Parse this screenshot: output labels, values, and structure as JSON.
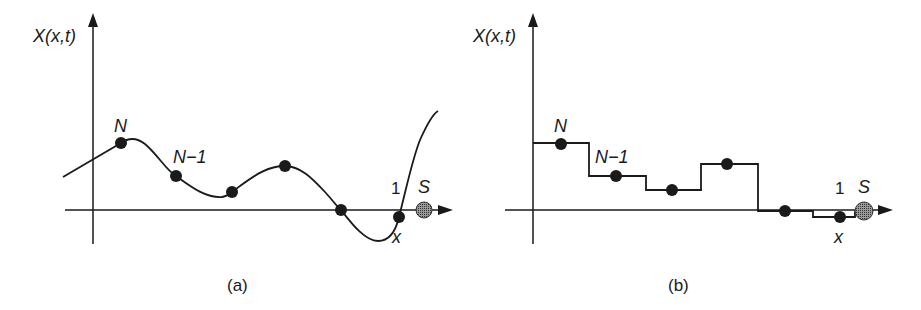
{
  "panels": [
    {
      "id": "a",
      "caption": "(a)",
      "y_axis_label": "X(x,t)",
      "curve_type": "smooth",
      "labels": {
        "top_point": "N",
        "second_point": "N−1",
        "last_point": "1",
        "sink": "S",
        "position": "x"
      },
      "points": [
        {
          "x": 121,
          "y": 143
        },
        {
          "x": 176,
          "y": 176
        },
        {
          "x": 232,
          "y": 192
        },
        {
          "x": 285,
          "y": 166
        },
        {
          "x": 341,
          "y": 210
        },
        {
          "x": 399,
          "y": 217
        }
      ]
    },
    {
      "id": "b",
      "caption": "(b)",
      "y_axis_label": "X(x,t)",
      "curve_type": "step",
      "labels": {
        "top_point": "N",
        "second_point": "N−1",
        "last_point": "1",
        "sink": "S",
        "position": "x"
      },
      "points": [
        {
          "x": 561,
          "y": 144
        },
        {
          "x": 616,
          "y": 176
        },
        {
          "x": 672,
          "y": 190
        },
        {
          "x": 727,
          "y": 164
        },
        {
          "x": 785,
          "y": 211
        },
        {
          "x": 840,
          "y": 217
        }
      ]
    }
  ],
  "colors": {
    "ink": "#1a1a1a",
    "sink_fill": "#7a7a7a"
  }
}
